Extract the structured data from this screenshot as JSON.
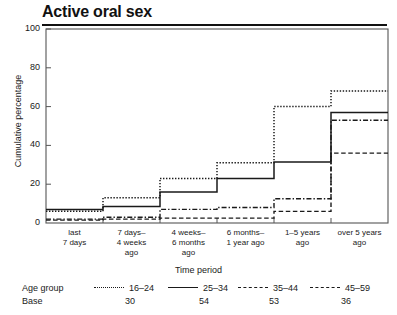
{
  "chart_data": {
    "type": "line",
    "subtype": "step",
    "title": "Active oral sex",
    "xlabel": "Time period",
    "ylabel": "Cumulative percentage",
    "ylim": [
      0,
      100
    ],
    "yticks": [
      0,
      20,
      40,
      60,
      80,
      100
    ],
    "grid": false,
    "legend_position": "below",
    "categories": [
      "last 7 days",
      "7 days–4 weeks ago",
      "4 weeks–6 months ago",
      "6 months–1 year ago",
      "1–5 years ago",
      "over 5 years ago"
    ],
    "category_lines": [
      [
        "last",
        "7 days"
      ],
      [
        "7 days–",
        "4 weeks",
        "ago"
      ],
      [
        "4 weeks–",
        "6 months",
        "ago"
      ],
      [
        "6 months–",
        "1 year ago"
      ],
      [
        "1–5 years",
        "ago"
      ],
      [
        "over 5 years",
        "ago"
      ]
    ],
    "series": [
      {
        "name": "16–24",
        "base": 30,
        "style": "dotted",
        "values": [
          6,
          13,
          23,
          31,
          60,
          68
        ]
      },
      {
        "name": "25–34",
        "base": 54,
        "style": "solid",
        "values": [
          7,
          8.5,
          16,
          23,
          31.5,
          57
        ]
      },
      {
        "name": "35–44",
        "base": 53,
        "style": "dashdot",
        "values": [
          2,
          3,
          7,
          8,
          12.5,
          53
        ]
      },
      {
        "name": "45–59",
        "base": 36,
        "style": "dashed",
        "values": [
          1.5,
          2,
          2.5,
          2.5,
          6,
          36
        ]
      }
    ]
  },
  "legend": {
    "series_row_label": "Age group",
    "base_row_label": "Base"
  },
  "colors": {
    "ink": "#1a1a1a",
    "axis": "#555555",
    "background": "#ffffff"
  }
}
